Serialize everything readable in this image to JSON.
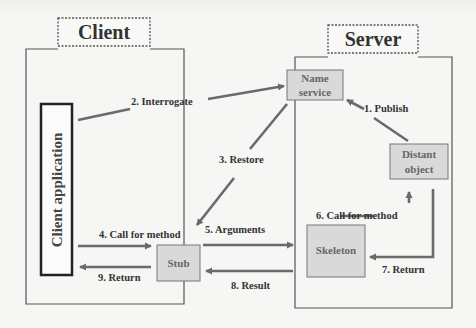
{
  "diagram": {
    "type": "client-server RMI architecture",
    "colors": {
      "background": "#f6f6f5",
      "box_fill": "#d9d9d9",
      "arrow": "#6a6a6a",
      "frame": "#555555"
    },
    "groups": {
      "client": {
        "label": "Client"
      },
      "server": {
        "label": "Server"
      }
    },
    "nodes": {
      "client_app": {
        "label": "Client application"
      },
      "name_service": {
        "line1": "Name",
        "line2": "service"
      },
      "distant_object": {
        "line1": "Distant",
        "line2": "object"
      },
      "stub": {
        "label": "Stub"
      },
      "skeleton": {
        "label": "Skeleton"
      }
    },
    "edges": [
      {
        "id": "1",
        "label": "1. Publish",
        "from": "distant_object",
        "to": "name_service"
      },
      {
        "id": "2",
        "label": "2. Interrogate",
        "from": "client_app",
        "to": "name_service"
      },
      {
        "id": "3",
        "label": "3. Restore",
        "from": "name_service",
        "to": "stub"
      },
      {
        "id": "4",
        "label": "4. Call for method",
        "from": "client_app",
        "to": "stub"
      },
      {
        "id": "5",
        "label": "5. Arguments",
        "from": "stub",
        "to": "skeleton"
      },
      {
        "id": "6",
        "label": "6. Call for method",
        "from": "skeleton",
        "to": "distant_object"
      },
      {
        "id": "7",
        "label": "7. Return",
        "from": "distant_object",
        "to": "skeleton"
      },
      {
        "id": "8",
        "label": "8. Result",
        "from": "skeleton",
        "to": "stub"
      },
      {
        "id": "9",
        "label": "9. Return",
        "from": "stub",
        "to": "client_app"
      }
    ]
  }
}
